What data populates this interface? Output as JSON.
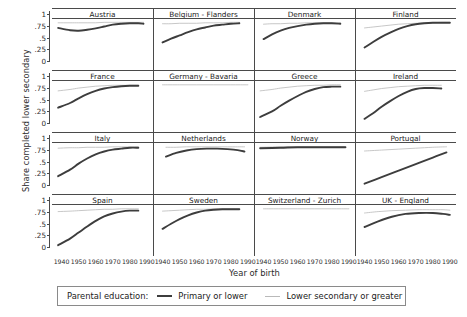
{
  "chart_data": {
    "type": "line",
    "title": "",
    "xlabel": "Year of birth",
    "ylabel": "Share completed lower secondary",
    "xlim": [
      1935,
      1993
    ],
    "ylim": [
      0,
      1.05
    ],
    "xticks": [
      1940,
      1950,
      1960,
      1970,
      1980,
      1990
    ],
    "yticks": [
      0,
      0.25,
      0.5,
      0.75,
      1
    ],
    "ytick_labels": [
      "0",
      ".25",
      ".5",
      ".75",
      "1"
    ],
    "grid": false,
    "legend_position": "bottom",
    "legend_title": "Parental education:",
    "series_names": [
      "Primary or lower",
      "Lower secondary or greater"
    ],
    "series_colors": [
      "#3d3d3d",
      "#b9b9b9"
    ],
    "layout": "4 rows x 4 columns small multiples",
    "panels": [
      {
        "name": "Austria",
        "x": [
          1938,
          1945,
          1950,
          1955,
          1960,
          1965,
          1970,
          1975,
          1980,
          1985,
          1988
        ],
        "series": [
          {
            "name": "Primary or lower",
            "values": [
              0.88,
              0.83,
              0.82,
              0.84,
              0.87,
              0.91,
              0.95,
              0.97,
              0.98,
              0.98,
              0.97
            ]
          },
          {
            "name": "Lower secondary or greater",
            "values": [
              0.99,
              0.99,
              0.99,
              0.99,
              0.99,
              1.0,
              1.0,
              1.0,
              1.0,
              1.0,
              1.0
            ]
          }
        ]
      },
      {
        "name": "Belgium - Flanders",
        "x": [
          1940,
          1945,
          1950,
          1955,
          1960,
          1965,
          1970,
          1975,
          1980,
          1985
        ],
        "series": [
          {
            "name": "Primary or lower",
            "values": [
              0.57,
              0.65,
              0.72,
              0.79,
              0.85,
              0.89,
              0.93,
              0.95,
              0.97,
              0.98
            ]
          },
          {
            "name": "Lower secondary or greater",
            "values": [
              0.97,
              0.97,
              0.98,
              0.98,
              0.98,
              0.99,
              0.99,
              0.99,
              1.0,
              1.0
            ]
          }
        ]
      },
      {
        "name": "Denmark",
        "x": [
          1940,
          1945,
          1950,
          1955,
          1960,
          1965,
          1970,
          1975,
          1980,
          1985
        ],
        "series": [
          {
            "name": "Primary or lower",
            "values": [
              0.64,
              0.74,
              0.82,
              0.88,
              0.92,
              0.95,
              0.97,
              0.98,
              0.98,
              0.97
            ]
          },
          {
            "name": "Lower secondary or greater",
            "values": [
              0.96,
              0.97,
              0.97,
              0.98,
              0.98,
              0.99,
              0.99,
              0.99,
              0.99,
              0.99
            ]
          }
        ]
      },
      {
        "name": "Finland",
        "x": [
          1940,
          1945,
          1950,
          1955,
          1960,
          1965,
          1970,
          1975,
          1980,
          1985,
          1990
        ],
        "series": [
          {
            "name": "Primary or lower",
            "values": [
              0.46,
              0.58,
              0.69,
              0.78,
              0.86,
              0.92,
              0.96,
              0.98,
              0.99,
              0.99,
              0.99
            ]
          },
          {
            "name": "Lower secondary or greater",
            "values": [
              0.88,
              0.9,
              0.92,
              0.94,
              0.96,
              0.97,
              0.98,
              0.99,
              0.99,
              1.0,
              1.0
            ]
          }
        ]
      },
      {
        "name": "France",
        "x": [
          1938,
          1945,
          1950,
          1955,
          1960,
          1965,
          1970,
          1975,
          1980,
          1985
        ],
        "series": [
          {
            "name": "Primary or lower",
            "values": [
              0.5,
              0.6,
              0.7,
              0.79,
              0.86,
              0.91,
              0.94,
              0.96,
              0.97,
              0.97
            ]
          },
          {
            "name": "Lower secondary or greater",
            "values": [
              0.86,
              0.89,
              0.92,
              0.94,
              0.96,
              0.97,
              0.98,
              0.98,
              0.98,
              0.98
            ]
          }
        ]
      },
      {
        "name": "Germany - Bavaria",
        "x": [
          1940,
          1950,
          1960,
          1970,
          1980,
          1990
        ],
        "series": [
          {
            "name": "Primary or lower",
            "values": [
              null,
              null,
              null,
              null,
              null,
              null
            ]
          },
          {
            "name": "Lower secondary or greater",
            "values": [
              0.99,
              0.99,
              0.99,
              0.99,
              0.99,
              0.99
            ]
          }
        ]
      },
      {
        "name": "Greece",
        "x": [
          1938,
          1945,
          1950,
          1955,
          1960,
          1965,
          1970,
          1975,
          1980,
          1985
        ],
        "series": [
          {
            "name": "Primary or lower",
            "values": [
              0.3,
              0.42,
              0.54,
              0.65,
              0.75,
              0.84,
              0.9,
              0.94,
              0.95,
              0.95
            ]
          },
          {
            "name": "Lower secondary or greater",
            "values": [
              0.86,
              0.89,
              0.92,
              0.94,
              0.96,
              0.97,
              0.98,
              0.98,
              0.99,
              0.99
            ]
          }
        ]
      },
      {
        "name": "Ireland",
        "x": [
          1940,
          1945,
          1950,
          1955,
          1960,
          1965,
          1970,
          1975,
          1980,
          1985
        ],
        "series": [
          {
            "name": "Primary or lower",
            "values": [
              0.26,
              0.38,
              0.52,
              0.64,
              0.75,
              0.84,
              0.9,
              0.92,
              0.92,
              0.91
            ]
          },
          {
            "name": "Lower secondary or greater",
            "values": [
              0.85,
              0.88,
              0.91,
              0.93,
              0.95,
              0.96,
              0.97,
              0.98,
              0.98,
              0.98
            ]
          }
        ]
      },
      {
        "name": "Italy",
        "x": [
          1938,
          1945,
          1950,
          1955,
          1960,
          1965,
          1970,
          1975,
          1980,
          1985
        ],
        "series": [
          {
            "name": "Primary or lower",
            "values": [
              0.36,
              0.5,
              0.63,
              0.74,
              0.83,
              0.89,
              0.93,
              0.95,
              0.97,
              0.97
            ]
          },
          {
            "name": "Lower secondary or greater",
            "values": [
              0.96,
              0.97,
              0.97,
              0.98,
              0.98,
              0.98,
              0.99,
              0.99,
              0.99,
              0.99
            ]
          }
        ]
      },
      {
        "name": "Netherlands",
        "x": [
          1942,
          1948,
          1954,
          1960,
          1966,
          1972,
          1978,
          1984,
          1988
        ],
        "series": [
          {
            "name": "Primary or lower",
            "values": [
              0.78,
              0.86,
              0.91,
              0.94,
              0.95,
              0.95,
              0.94,
              0.92,
              0.89
            ]
          },
          {
            "name": "Lower secondary or greater",
            "values": [
              0.98,
              0.98,
              0.99,
              0.99,
              0.99,
              0.99,
              0.99,
              0.99,
              0.99
            ]
          }
        ]
      },
      {
        "name": "Norway",
        "x": [
          1938,
          1950,
          1960,
          1970,
          1980,
          1988
        ],
        "series": [
          {
            "name": "Primary or lower",
            "values": [
              0.96,
              0.97,
              0.98,
              0.98,
              0.98,
              0.98
            ]
          },
          {
            "name": "Lower secondary or greater",
            "values": [
              0.98,
              0.99,
              0.99,
              0.99,
              0.99,
              0.99
            ]
          }
        ]
      },
      {
        "name": "Portugal",
        "x": [
          1940,
          1950,
          1960,
          1970,
          1980,
          1988
        ],
        "series": [
          {
            "name": "Primary or lower",
            "values": [
              0.2,
              0.34,
              0.48,
              0.62,
              0.76,
              0.87
            ]
          },
          {
            "name": "Lower secondary or greater",
            "values": [
              0.9,
              0.92,
              0.94,
              0.96,
              0.98,
              0.99
            ]
          }
        ]
      },
      {
        "name": "Spain",
        "x": [
          1938,
          1945,
          1950,
          1955,
          1960,
          1965,
          1970,
          1975,
          1980,
          1985
        ],
        "series": [
          {
            "name": "Primary or lower",
            "values": [
              0.21,
              0.35,
              0.48,
              0.61,
              0.73,
              0.83,
              0.89,
              0.93,
              0.95,
              0.95
            ]
          },
          {
            "name": "Lower secondary or greater",
            "values": [
              0.93,
              0.94,
              0.95,
              0.96,
              0.97,
              0.98,
              0.98,
              0.99,
              0.99,
              0.99
            ]
          }
        ]
      },
      {
        "name": "Sweden",
        "x": [
          1940,
          1945,
          1950,
          1955,
          1960,
          1965,
          1970,
          1975,
          1980,
          1985
        ],
        "series": [
          {
            "name": "Primary or lower",
            "values": [
              0.56,
              0.67,
              0.77,
              0.85,
              0.91,
              0.95,
              0.97,
              0.98,
              0.98,
              0.98
            ]
          },
          {
            "name": "Lower secondary or greater",
            "values": [
              0.94,
              0.95,
              0.96,
              0.97,
              0.98,
              0.98,
              0.99,
              0.99,
              0.99,
              0.99
            ]
          }
        ]
      },
      {
        "name": "Switzerland - Zurich",
        "x": [
          1940,
          1950,
          1960,
          1970,
          1980,
          1990
        ],
        "series": [
          {
            "name": "Primary or lower",
            "values": [
              null,
              null,
              null,
              null,
              null,
              null
            ]
          },
          {
            "name": "Lower secondary or greater",
            "values": [
              0.99,
              0.99,
              0.99,
              0.99,
              0.99,
              0.99
            ]
          }
        ]
      },
      {
        "name": "UK - England",
        "x": [
          1940,
          1948,
          1956,
          1964,
          1972,
          1980,
          1986,
          1990
        ],
        "series": [
          {
            "name": "Primary or lower",
            "values": [
              0.6,
              0.72,
              0.82,
              0.88,
              0.9,
              0.9,
              0.88,
              0.86
            ]
          },
          {
            "name": "Lower secondary or greater",
            "values": [
              0.9,
              0.93,
              0.95,
              0.96,
              0.97,
              0.97,
              0.97,
              0.96
            ]
          }
        ]
      }
    ]
  }
}
